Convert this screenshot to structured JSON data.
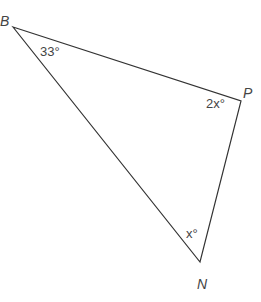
{
  "diagram": {
    "type": "triangle",
    "vertices": [
      {
        "name": "B",
        "x": 13,
        "y": 27
      },
      {
        "name": "P",
        "x": 241,
        "y": 101
      },
      {
        "name": "N",
        "x": 200,
        "y": 262
      }
    ],
    "labels": {
      "B": "B",
      "P": "P",
      "N": "N"
    },
    "angles": {
      "B": "33°",
      "P": "2x°",
      "N": "x°"
    },
    "colors": {
      "line": "#333333",
      "text": "#444444"
    }
  }
}
